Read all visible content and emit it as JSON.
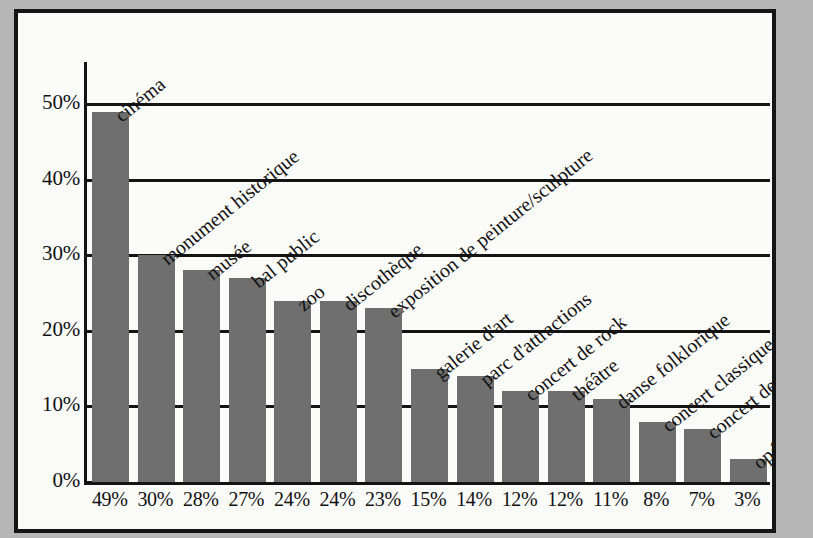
{
  "chart_data": {
    "type": "bar",
    "title": "",
    "subtitle": "",
    "xlabel": "",
    "ylabel": "",
    "ylim": [
      0,
      55
    ],
    "grid": true,
    "legend": false,
    "orientation": "vertical",
    "bar_color": "#6f6f6f",
    "axis_color": "#141414",
    "background_color": "#fbfbfa",
    "page_color": "#b7b7b7",
    "categories": [
      "cinéma",
      "monument historique",
      "musée",
      "bal public",
      "zoo",
      "discothèque",
      "exposition de peinture/sculpture",
      "galerie d'art",
      "parc d'attractions",
      "concert de rock",
      "théâtre",
      "danse folklorique",
      "concert classique",
      "concert de jazz",
      "opéra"
    ],
    "values": [
      49,
      30,
      28,
      27,
      24,
      24,
      23,
      15,
      14,
      12,
      12,
      11,
      8,
      7,
      3
    ],
    "value_labels": [
      "49%",
      "30%",
      "28%",
      "27%",
      "24%",
      "24%",
      "23%",
      "15%",
      "14%",
      "12%",
      "12%",
      "11%",
      "8%",
      "7%",
      "3%"
    ],
    "ytick_values": [
      0,
      10,
      20,
      30,
      40,
      50
    ],
    "ytick_labels": [
      "0%",
      "10%",
      "20%",
      "30%",
      "40%",
      "50%"
    ]
  }
}
